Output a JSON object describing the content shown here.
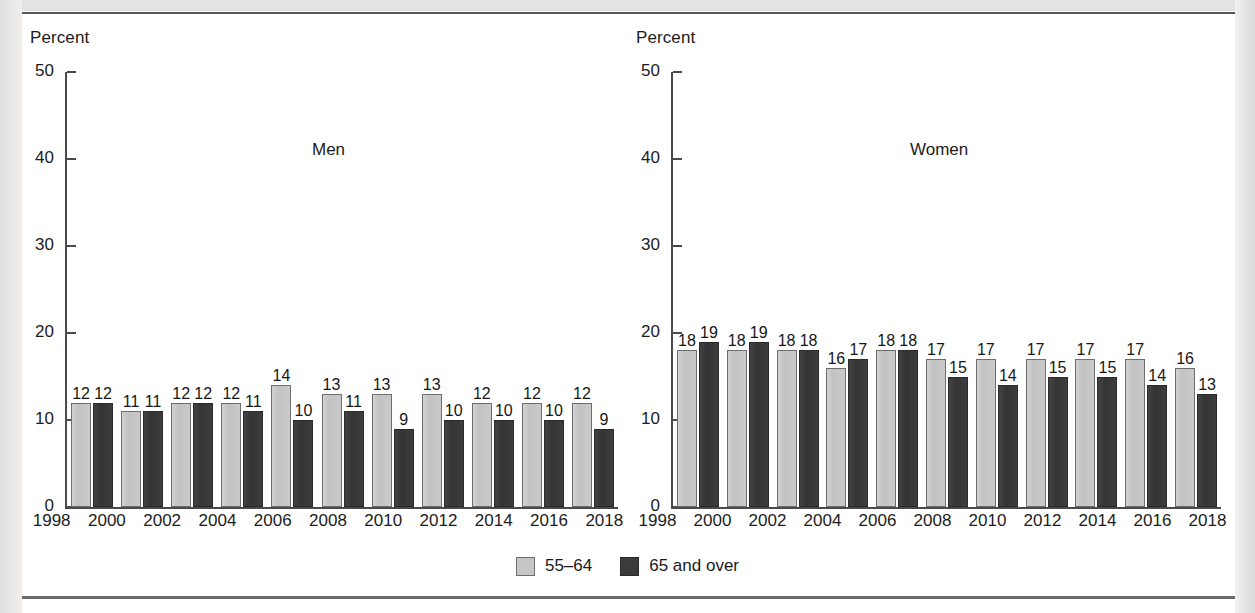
{
  "figure": {
    "y_axis_title": "Percent",
    "panels": [
      {
        "key": "men",
        "label": "Men"
      },
      {
        "key": "women",
        "label": "Women"
      }
    ]
  },
  "legend": {
    "position": "bottom-center",
    "items": [
      {
        "label": "55–64",
        "color": "#c6c6c6",
        "swatch": "light-gray-square"
      },
      {
        "label": "65 and over",
        "color": "#3b3b3b",
        "swatch": "dark-gray-square"
      }
    ]
  },
  "colors": {
    "series_55_64": "#c6c6c6",
    "series_65_over": "#3b3b3b",
    "axis": "#4a4a4a",
    "text": "#1c1c1c",
    "page": "#ffffff",
    "scan_margin": "#e4e3e1",
    "rule": "#5a5a5a"
  },
  "chart_data": [
    {
      "type": "bar",
      "title": "Men",
      "xlabel": "",
      "ylabel": "Percent",
      "ylim": [
        0,
        50
      ],
      "yticks": [
        0,
        10,
        20,
        30,
        40,
        50
      ],
      "grid": false,
      "legend_position": "bottom-center",
      "categories": [
        "1998",
        "2000",
        "2002",
        "2004",
        "2006",
        "2008",
        "2010",
        "2012",
        "2014",
        "2016",
        "2018"
      ],
      "series": [
        {
          "name": "55–64",
          "values": [
            12,
            11,
            12,
            12,
            14,
            13,
            13,
            13,
            12,
            12,
            12
          ]
        },
        {
          "name": "65 and over",
          "values": [
            12,
            11,
            12,
            11,
            10,
            11,
            9,
            10,
            10,
            10,
            9
          ]
        }
      ]
    },
    {
      "type": "bar",
      "title": "Women",
      "xlabel": "",
      "ylabel": "Percent",
      "ylim": [
        0,
        50
      ],
      "yticks": [
        0,
        10,
        20,
        30,
        40,
        50
      ],
      "grid": false,
      "legend_position": "bottom-center",
      "categories": [
        "1998",
        "2000",
        "2002",
        "2004",
        "2006",
        "2008",
        "2010",
        "2012",
        "2014",
        "2016",
        "2018"
      ],
      "series": [
        {
          "name": "55–64",
          "values": [
            18,
            18,
            18,
            16,
            18,
            17,
            17,
            17,
            17,
            17,
            16
          ]
        },
        {
          "name": "65 and over",
          "values": [
            19,
            19,
            18,
            17,
            18,
            15,
            14,
            15,
            15,
            14,
            13
          ]
        }
      ]
    }
  ]
}
